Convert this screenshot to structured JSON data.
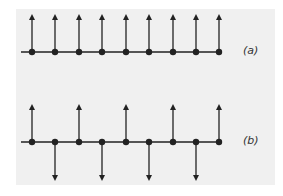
{
  "colors": {
    "background": "#f0f0f0",
    "stroke": "#222222"
  },
  "diagrams": [
    {
      "id": "a",
      "label": "(a)",
      "axis_y": 52,
      "axis_x_start": 21,
      "axis_x_end": 222,
      "points_x": [
        32,
        55,
        79,
        102,
        126,
        149,
        173,
        196,
        219
      ],
      "directions": [
        "up",
        "up",
        "up",
        "up",
        "up",
        "up",
        "up",
        "up",
        "up"
      ],
      "tip_up_y": 14,
      "tip_down_y": 90,
      "label_x": 250
    },
    {
      "id": "b",
      "label": "(b)",
      "axis_y": 142,
      "axis_x_start": 21,
      "axis_x_end": 222,
      "points_x": [
        32,
        55,
        79,
        102,
        126,
        149,
        173,
        196,
        219
      ],
      "directions": [
        "up",
        "down",
        "up",
        "down",
        "up",
        "down",
        "up",
        "down",
        "up"
      ],
      "tip_up_y": 104,
      "tip_down_y": 181,
      "label_x": 250
    }
  ]
}
